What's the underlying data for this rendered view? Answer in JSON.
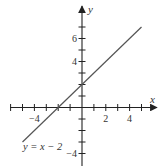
{
  "chart_data": {
    "type": "line",
    "title": "",
    "xlabel": "x",
    "ylabel": "y",
    "xlim": [
      -6.8,
      5.8
    ],
    "ylim": [
      -5.2,
      8.2
    ],
    "grid": false,
    "x_ticks": [
      -6,
      -5,
      -4,
      -3,
      -2,
      -1,
      1,
      2,
      3,
      4,
      5
    ],
    "x_tick_labels": [
      {
        "value": -4,
        "text": "−4"
      },
      {
        "value": 2,
        "text": "2"
      },
      {
        "value": 4,
        "text": "4"
      }
    ],
    "y_ticks": [
      -4,
      -3,
      -2,
      -1,
      1,
      2,
      3,
      4,
      5,
      6,
      7
    ],
    "y_tick_labels": [
      {
        "value": 6,
        "text": "6"
      },
      {
        "value": 4,
        "text": "4"
      },
      {
        "value": -4,
        "text": "−4"
      }
    ],
    "series": [
      {
        "name": "y = x − 2",
        "points": [
          [
            -5,
            -3
          ],
          [
            5,
            7
          ]
        ]
      }
    ],
    "annotations": [
      {
        "text": "y = x − 2",
        "x": -5.3,
        "y": -3.6
      }
    ],
    "line_color": "#555555",
    "axis_color": "#222222"
  }
}
